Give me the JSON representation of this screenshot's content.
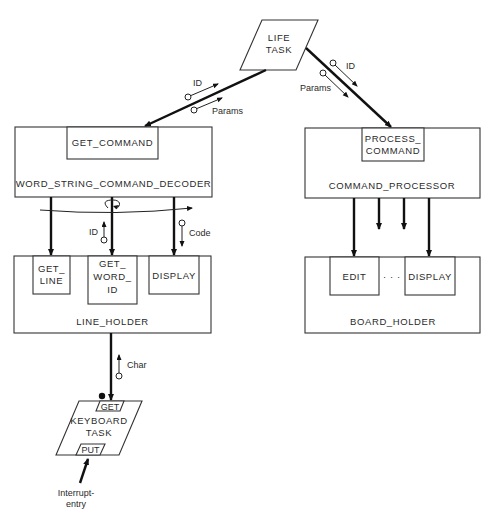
{
  "diagram": {
    "life_task": {
      "line1": "LIFE",
      "line2": "TASK"
    },
    "decoder": {
      "label": "WORD_STRING_COMMAND_DECODER",
      "entry": "GET_COMMAND"
    },
    "processor": {
      "label": "COMMAND_PROCESSOR",
      "entry_line1": "PROCESS_",
      "entry_line2": "COMMAND"
    },
    "line_holder": {
      "label": "LINE_HOLDER",
      "entries": [
        {
          "line1": "GET_",
          "line2": "LINE"
        },
        {
          "line1": "GET_",
          "line2": "WORD_",
          "line3": "ID"
        },
        {
          "line1": "DISPLAY"
        }
      ]
    },
    "board_holder": {
      "label": "BOARD_HOLDER",
      "entries": [
        {
          "line1": "EDIT"
        },
        {
          "line1": "DISPLAY"
        }
      ],
      "ellipsis": "· · ·"
    },
    "keyboard_task": {
      "line1": "KEYBOARD",
      "line2": "TASK",
      "get_entry": "GET",
      "put_entry": "PUT"
    },
    "flows": {
      "left_id": "ID",
      "left_params": "Params",
      "right_id": "ID",
      "right_params": "Params",
      "word_id": "ID",
      "code": "Code",
      "char": "Char"
    },
    "interrupt": {
      "line1": "Interrupt-",
      "line2": "entry"
    }
  }
}
